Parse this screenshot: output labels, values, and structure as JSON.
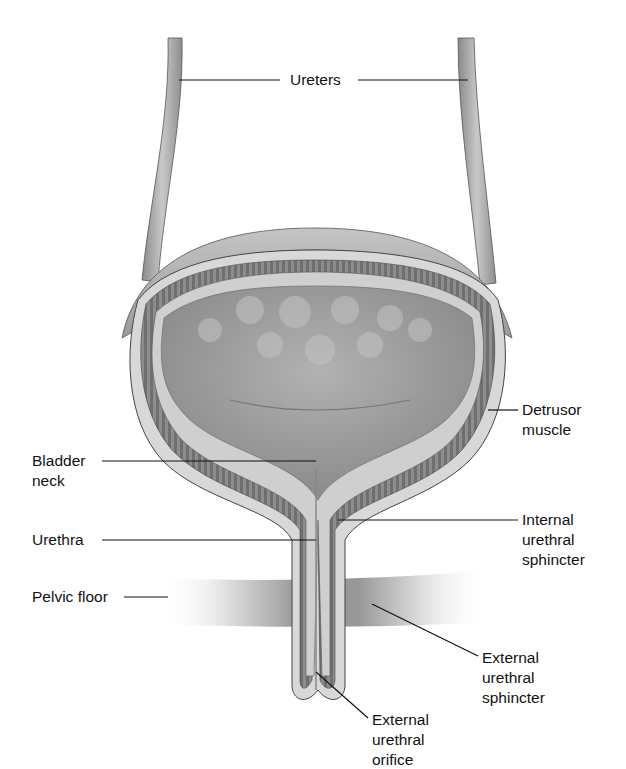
{
  "diagram": {
    "type": "anatomical illustration",
    "colors": {
      "background": "#ffffff",
      "tissue_light": "#d6d6d6",
      "tissue_mid": "#a9a9a9",
      "tissue_dark": "#6e6e6e",
      "leader_line": "#111111"
    },
    "labels": {
      "ureters": "Ureters",
      "detrusor": "Detrusor\nmuscle",
      "bladder_neck": "Bladder\nneck",
      "urethra": "Urethra",
      "internal_sphincter": "Internal\nurethral\nsphincter",
      "pelvic_floor": "Pelvic floor",
      "external_sphincter": "External\nurethral\nsphincter",
      "external_orifice": "External\nurethral\norifice"
    }
  }
}
